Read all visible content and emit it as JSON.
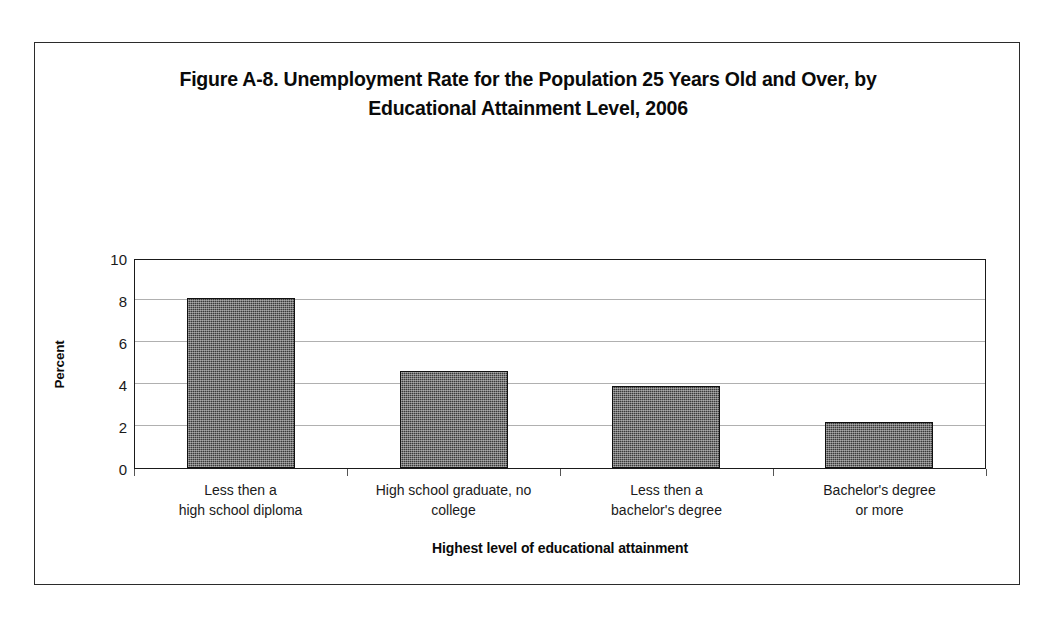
{
  "figure": {
    "title_line1": "Figure A-8. Unemployment Rate for the Population 25 Years Old and Over, by",
    "title_line2": "Educational Attainment Level, 2006",
    "border_color": "#2b2b2b",
    "background_color": "#ffffff"
  },
  "chart_data": {
    "type": "bar",
    "title": "Figure A-8. Unemployment Rate for the Population 25 Years Old and Over, by Educational Attainment Level, 2006",
    "xlabel": "Highest level of educational attainment",
    "ylabel": "Percent",
    "categories": [
      "Less then a high school diploma",
      "High school graduate, no college",
      "Less then a bachelor's degree",
      "Bachelor's degree or more"
    ],
    "category_lines": [
      [
        "Less then a",
        "high school diploma"
      ],
      [
        "High school graduate, no",
        "college"
      ],
      [
        "Less then a",
        "bachelor's degree"
      ],
      [
        "Bachelor's degree",
        "or more"
      ]
    ],
    "values": [
      8.1,
      4.6,
      3.9,
      2.2
    ],
    "ylim": [
      0,
      10
    ],
    "yticks": [
      0,
      2,
      4,
      6,
      8,
      10
    ],
    "ytick_labels": [
      "0",
      "2",
      "4",
      "6",
      "8",
      "10"
    ],
    "grid": true,
    "grid_axis": "y",
    "legend": false,
    "bar_color": "#3a3a3a",
    "bar_edge_color": "#111111",
    "gridline_color": "#b0b0b0",
    "axis_color": "#1a1a1a"
  }
}
